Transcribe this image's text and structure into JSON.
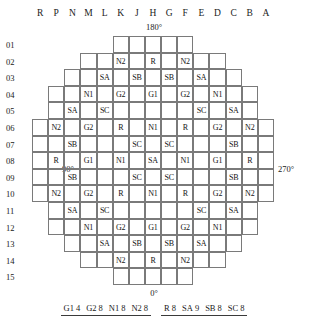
{
  "map": {
    "title_angles": {
      "top": "180°",
      "bottom": "0°",
      "left": "90°",
      "right": "270°"
    },
    "column_headers": [
      "R",
      "P",
      "N",
      "M",
      "L",
      "K",
      "J",
      "H",
      "G",
      "F",
      "E",
      "D",
      "C",
      "B",
      "A"
    ],
    "row_numbers": [
      "01",
      "02",
      "03",
      "04",
      "05",
      "06",
      "07",
      "08",
      "09",
      "10",
      "11",
      "12",
      "13",
      "14",
      "15"
    ],
    "rows": [
      {
        "id": "01",
        "offset": 5,
        "cells": [
          "",
          "",
          "",
          "",
          ""
        ]
      },
      {
        "id": "02",
        "offset": 3,
        "cells": [
          "",
          "",
          "N2",
          "",
          "R",
          "",
          "N2",
          "",
          ""
        ]
      },
      {
        "id": "03",
        "offset": 2,
        "cells": [
          "",
          "",
          "SA",
          "",
          "SB",
          "",
          "SB",
          "",
          "SA",
          "",
          ""
        ]
      },
      {
        "id": "04",
        "offset": 1,
        "cells": [
          "",
          "",
          "N1",
          "",
          "G2",
          "",
          "G1",
          "",
          "G2",
          "",
          "N1",
          "",
          ""
        ]
      },
      {
        "id": "05",
        "offset": 1,
        "cells": [
          "",
          "SA",
          "",
          "SC",
          "",
          "",
          "",
          "",
          "",
          "SC",
          "",
          "SA",
          ""
        ]
      },
      {
        "id": "06",
        "offset": 0,
        "cells": [
          "",
          "N2",
          "",
          "G2",
          "",
          "R",
          "",
          "N1",
          "",
          "R",
          "",
          "G2",
          "",
          "N2",
          ""
        ]
      },
      {
        "id": "07",
        "offset": 0,
        "cells": [
          "",
          "",
          "SB",
          "",
          "",
          "",
          "SC",
          "",
          "SC",
          "",
          "",
          "",
          "SB",
          "",
          ""
        ]
      },
      {
        "id": "08",
        "offset": 0,
        "cells": [
          "",
          "R",
          "",
          "G1",
          "",
          "N1",
          "",
          "SA",
          "",
          "N1",
          "",
          "G1",
          "",
          "R",
          ""
        ]
      },
      {
        "id": "09",
        "offset": 0,
        "cells": [
          "",
          "",
          "SB",
          "",
          "",
          "",
          "SC",
          "",
          "SC",
          "",
          "",
          "",
          "SB",
          "",
          ""
        ]
      },
      {
        "id": "10",
        "offset": 0,
        "cells": [
          "",
          "N2",
          "",
          "G2",
          "",
          "R",
          "",
          "N1",
          "",
          "R",
          "",
          "G2",
          "",
          "N2",
          ""
        ]
      },
      {
        "id": "11",
        "offset": 1,
        "cells": [
          "",
          "SA",
          "",
          "SC",
          "",
          "",
          "",
          "",
          "",
          "SC",
          "",
          "SA",
          ""
        ]
      },
      {
        "id": "12",
        "offset": 1,
        "cells": [
          "",
          "",
          "N1",
          "",
          "G2",
          "",
          "G1",
          "",
          "G2",
          "",
          "N1",
          "",
          ""
        ]
      },
      {
        "id": "13",
        "offset": 2,
        "cells": [
          "",
          "",
          "SA",
          "",
          "SB",
          "",
          "SB",
          "",
          "SA",
          "",
          ""
        ]
      },
      {
        "id": "14",
        "offset": 3,
        "cells": [
          "",
          "",
          "N2",
          "",
          "R",
          "",
          "N2",
          "",
          ""
        ]
      },
      {
        "id": "15",
        "offset": 5,
        "cells": [
          "",
          "",
          "",
          "",
          ""
        ]
      }
    ]
  },
  "legend": {
    "groups": [
      {
        "name": "control-and-burnable-group",
        "items": [
          {
            "key": "G1",
            "count": "4"
          },
          {
            "key": "G2",
            "count": "8"
          },
          {
            "key": "N1",
            "count": "8"
          },
          {
            "key": "N2",
            "count": "8"
          }
        ]
      },
      {
        "name": "regulating-and-shutdown-group",
        "items": [
          {
            "key": "R",
            "count": "8"
          },
          {
            "key": "SA",
            "count": "9"
          },
          {
            "key": "SB",
            "count": "8"
          },
          {
            "key": "SC",
            "count": "8"
          }
        ]
      }
    ]
  }
}
